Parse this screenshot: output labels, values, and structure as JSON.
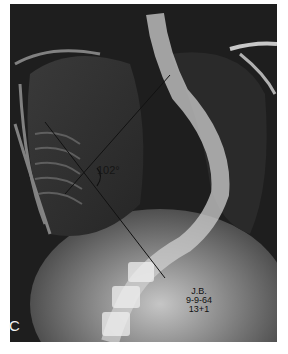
{
  "figure": {
    "panel_letter": "C",
    "cobb_angle": "102°",
    "patient_initials": "J.B.",
    "date": "9-9-64",
    "age": "13+1"
  },
  "colors": {
    "background": "#1a1a1a",
    "bone": "#e8e8e8",
    "frame_border": "#ffffff"
  }
}
